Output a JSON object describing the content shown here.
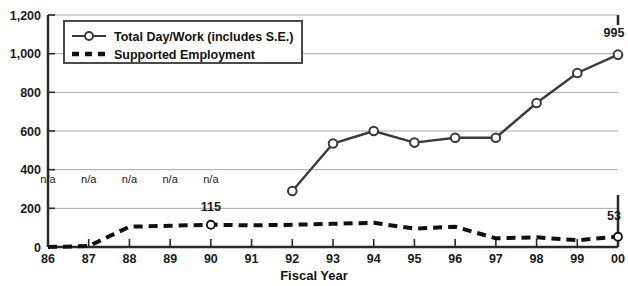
{
  "chart_data": {
    "type": "line",
    "title": "",
    "xlabel": "Fiscal Year",
    "ylabel": "",
    "categories": [
      "86",
      "87",
      "88",
      "89",
      "90",
      "91",
      "92",
      "93",
      "94",
      "95",
      "96",
      "97",
      "98",
      "99",
      "00"
    ],
    "ylim": [
      0,
      1200
    ],
    "ytick_values": [
      0,
      200,
      400,
      600,
      800,
      1000,
      1200
    ],
    "ytick_labels": [
      "0",
      "200",
      "400",
      "600",
      "800",
      "1,000",
      "1,200"
    ],
    "grid": "horizontal",
    "legend_position": "top-left-inside",
    "series": [
      {
        "name": "Total Day/Work (includes S.E.)",
        "style": "solid-with-markers",
        "color": "#3a3a3a",
        "values": [
          null,
          null,
          null,
          null,
          null,
          null,
          290,
          535,
          600,
          540,
          565,
          565,
          745,
          900,
          995
        ]
      },
      {
        "name": "Supported Employment",
        "style": "dashed",
        "color": "#111111",
        "values": [
          0,
          5,
          105,
          110,
          115,
          112,
          115,
          120,
          125,
          95,
          105,
          45,
          50,
          35,
          53
        ]
      }
    ],
    "annotations": [
      {
        "text": "n/a",
        "category": "86",
        "value": 330,
        "note": "no data for Total Day/Work"
      },
      {
        "text": "n/a",
        "category": "87",
        "value": 330,
        "note": "no data for Total Day/Work"
      },
      {
        "text": "n/a",
        "category": "88",
        "value": 330,
        "note": "no data for Total Day/Work"
      },
      {
        "text": "n/a",
        "category": "89",
        "value": 330,
        "note": "no data for Total Day/Work"
      },
      {
        "text": "n/a",
        "category": "90",
        "value": 330,
        "note": "no data for Total Day/Work"
      },
      {
        "text": "115",
        "category": "90",
        "value": 185,
        "note": "Supported Employment data label"
      },
      {
        "text": "995",
        "category": "00",
        "value": 1085,
        "note": "Total Day/Work data label"
      },
      {
        "text": "53",
        "category": "00",
        "value": 140,
        "note": "Supported Employment data label"
      }
    ]
  },
  "legend": {
    "items": [
      {
        "label": "Total Day/Work (includes S.E.)",
        "marker": "line-with-circle-marker"
      },
      {
        "label": "Supported Employment",
        "marker": "dashed-line"
      }
    ]
  },
  "axis": {
    "x_title": "Fiscal Year"
  }
}
